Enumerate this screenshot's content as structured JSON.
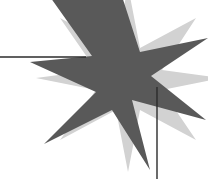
{
  "canvas": {
    "width": 208,
    "height": 179,
    "background_color": "#ffffff"
  },
  "graphic": {
    "title": "overlapping-stars-with-rules",
    "description": "A dark gray multi-pointed star overlapping a light gray multi-pointed star, crossed by a thin horizontal rule on the left and a thin vertical rule on the lower right.",
    "shapes": [
      {
        "name": "back-star",
        "kind": "star",
        "fill": "#d2d2d2",
        "points": 8,
        "center_x": 128,
        "center_y": 78,
        "outer_radius": 92,
        "inner_radius": 30,
        "rotation_deg": 12,
        "polygon": "128,-14 140,48 196,18 162,70 222,78 162,90 196,140 140,110 128,172 116,110 60,140 96,90 36,78 96,70 60,18 116,48"
      },
      {
        "name": "front-star",
        "kind": "star",
        "fill": "#595959",
        "points": 7,
        "center_x": 112,
        "center_y": 76,
        "outer_radius": 88,
        "inner_radius": 28,
        "rotation_deg": -8,
        "polygon": "118,-16 140,52 208,38 151,76 206,120 132,100 150,170 112,110 44,144 96,92 30,62 92,56 48,-6"
      }
    ],
    "lines": [
      {
        "name": "horizontal-rule",
        "orientation": "horizontal",
        "color": "#2b2b2b",
        "thickness": 1.4,
        "x1": 0,
        "y1": 57,
        "x2": 86,
        "y2": 57
      },
      {
        "name": "vertical-rule",
        "orientation": "vertical",
        "color": "#2b2b2b",
        "thickness": 1.4,
        "x1": 157,
        "y1": 87,
        "x2": 157,
        "y2": 179
      }
    ]
  },
  "colors": {
    "background": "#ffffff",
    "dark_star": "#595959",
    "light_star": "#d2d2d2",
    "rule": "#2b2b2b"
  }
}
